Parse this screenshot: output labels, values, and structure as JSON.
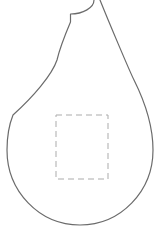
{
  "figure": {
    "background_color": "#ffffff",
    "outline": {
      "name": "pear-body-outline",
      "stroke_color": "#6b6b6b",
      "stroke_width": 1.2,
      "path": "M94,0 C94,7.7 83,14 70.5,14 L70.5,22 C65,35 60,47 57,60 C52,75 33,97 13,115 C9,125 7,137 7,150 C7,191 39,225 80,225 C121,225 153,191 153,150 C153,125 143,98 134,80 C129.5,71 108,20 100,0"
    },
    "dashed_rect": {
      "name": "dashed-region",
      "stroke_color": "#ababab",
      "stroke_width": 1,
      "dash_pattern": "6 4",
      "x": 56,
      "y": 115,
      "width": 52,
      "height": 64
    }
  }
}
